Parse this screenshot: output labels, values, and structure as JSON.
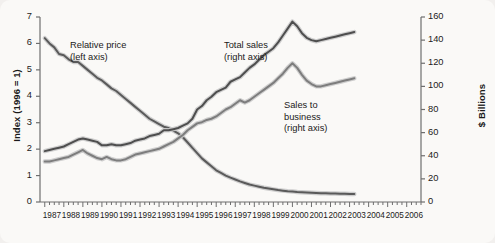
{
  "chart_data": {
    "type": "line",
    "title": "",
    "xlabel": "",
    "ylabel": "Index (1996 = 1)",
    "y2label": "$ Billions",
    "grid": false,
    "legend_position": "inline-annotations",
    "xlim": [
      1986.75,
      2006.75
    ],
    "ylim": [
      0,
      7
    ],
    "y2lim": [
      0,
      160
    ],
    "xticks": [
      "1987",
      "1988",
      "1989",
      "1990",
      "1991",
      "1992",
      "1993",
      "1994",
      "1995",
      "1996",
      "1997",
      "1998",
      "1999",
      "2000",
      "2001",
      "2002",
      "2003",
      "2004",
      "2005",
      "2006"
    ],
    "yticks_left": [
      "0",
      "1",
      "2",
      "3",
      "4",
      "5",
      "6",
      "7"
    ],
    "yticks_right": [
      "0",
      "20",
      "40",
      "60",
      "80",
      "100",
      "120",
      "140",
      "160"
    ],
    "minor_tick_interval_years": 0.25,
    "annotations": [
      {
        "name": "relative-price",
        "line1": "Relative price",
        "line2": "(left axis)"
      },
      {
        "name": "total-sales",
        "line1": "Total sales",
        "line2": "(right axis)"
      },
      {
        "name": "sales-to-business",
        "line1": "Sales to",
        "line2": "business",
        "line3": "(right axis)"
      }
    ],
    "series": [
      {
        "name": "Relative price",
        "axis": "left",
        "units": "index (1996 = 1)",
        "color": "#5a5a5a",
        "x": [
          1987.0,
          1987.25,
          1987.5,
          1987.75,
          1988.0,
          1988.25,
          1988.5,
          1988.75,
          1989.0,
          1989.25,
          1989.5,
          1989.75,
          1990.0,
          1990.25,
          1990.5,
          1990.75,
          1991.0,
          1991.25,
          1991.5,
          1991.75,
          1992.0,
          1992.25,
          1992.5,
          1992.75,
          1993.0,
          1993.25,
          1993.5,
          1993.75,
          1994.0,
          1994.25,
          1994.5,
          1994.75,
          1995.0,
          1995.25,
          1995.5,
          1995.75,
          1996.0,
          1996.25,
          1996.5,
          1996.75,
          1997.0,
          1997.25,
          1997.5,
          1997.75,
          1998.0,
          1998.25,
          1998.5,
          1998.75,
          1999.0,
          1999.25,
          1999.5,
          1999.75,
          2000.0,
          2000.25,
          2000.5,
          2000.75,
          2001.0,
          2001.25,
          2001.5,
          2001.75,
          2002.0,
          2002.25,
          2002.5,
          2002.75,
          2003.0,
          2003.25
        ],
        "y": [
          6.2,
          6.0,
          5.85,
          5.6,
          5.55,
          5.4,
          5.3,
          5.3,
          5.15,
          5.0,
          4.85,
          4.7,
          4.6,
          4.45,
          4.3,
          4.2,
          4.05,
          3.9,
          3.75,
          3.6,
          3.45,
          3.3,
          3.15,
          3.05,
          2.95,
          2.85,
          2.8,
          2.7,
          2.6,
          2.45,
          2.25,
          2.05,
          1.85,
          1.65,
          1.5,
          1.35,
          1.2,
          1.1,
          1.0,
          0.92,
          0.85,
          0.78,
          0.72,
          0.66,
          0.62,
          0.58,
          0.54,
          0.51,
          0.48,
          0.45,
          0.43,
          0.41,
          0.4,
          0.38,
          0.37,
          0.36,
          0.35,
          0.34,
          0.33,
          0.33,
          0.32,
          0.32,
          0.31,
          0.31,
          0.3,
          0.3
        ]
      },
      {
        "name": "Total sales",
        "axis": "right",
        "units": "$ Billions",
        "color": "#4e4e4e",
        "x": [
          1987.0,
          1987.25,
          1987.5,
          1987.75,
          1988.0,
          1988.25,
          1988.5,
          1988.75,
          1989.0,
          1989.25,
          1989.5,
          1989.75,
          1990.0,
          1990.25,
          1990.5,
          1990.75,
          1991.0,
          1991.25,
          1991.5,
          1991.75,
          1992.0,
          1992.25,
          1992.5,
          1992.75,
          1993.0,
          1993.25,
          1993.5,
          1993.75,
          1994.0,
          1994.25,
          1994.5,
          1994.75,
          1995.0,
          1995.25,
          1995.5,
          1995.75,
          1996.0,
          1996.25,
          1996.5,
          1996.75,
          1997.0,
          1997.25,
          1997.5,
          1997.75,
          1998.0,
          1998.25,
          1998.5,
          1998.75,
          1999.0,
          1999.25,
          1999.5,
          1999.75,
          2000.0,
          2000.25,
          2000.5,
          2000.75,
          2001.0,
          2001.25,
          2001.5,
          2001.75,
          2002.0,
          2002.25,
          2002.5,
          2002.75,
          2003.0,
          2003.25
        ],
        "y": [
          44,
          45,
          46,
          47,
          48,
          50,
          52,
          54,
          55,
          54,
          53,
          52,
          49,
          49,
          50,
          49,
          49,
          50,
          51,
          53,
          54,
          55,
          57,
          58,
          59,
          62,
          62,
          63,
          64,
          66,
          68,
          72,
          80,
          83,
          88,
          91,
          95,
          97,
          99,
          104,
          106,
          108,
          112,
          116,
          119,
          123,
          127,
          130,
          133,
          138,
          144,
          150,
          156,
          152,
          146,
          142,
          140,
          139,
          140,
          141,
          142,
          143,
          144,
          145,
          146,
          147
        ]
      },
      {
        "name": "Sales to business",
        "axis": "right",
        "units": "$ Billions",
        "color": "#7d7d7d",
        "x": [
          1987.0,
          1987.25,
          1987.5,
          1987.75,
          1988.0,
          1988.25,
          1988.5,
          1988.75,
          1989.0,
          1989.25,
          1989.5,
          1989.75,
          1990.0,
          1990.25,
          1990.5,
          1990.75,
          1991.0,
          1991.25,
          1991.5,
          1991.75,
          1992.0,
          1992.25,
          1992.5,
          1992.75,
          1993.0,
          1993.25,
          1993.5,
          1993.75,
          1994.0,
          1994.25,
          1994.5,
          1994.75,
          1995.0,
          1995.25,
          1995.5,
          1995.75,
          1996.0,
          1996.25,
          1996.5,
          1996.75,
          1997.0,
          1997.25,
          1997.5,
          1997.75,
          1998.0,
          1998.25,
          1998.5,
          1998.75,
          1999.0,
          1999.25,
          1999.5,
          1999.75,
          2000.0,
          2000.25,
          2000.5,
          2000.75,
          2001.0,
          2001.25,
          2001.5,
          2001.75,
          2002.0,
          2002.25,
          2002.5,
          2002.75,
          2003.0,
          2003.25
        ],
        "y": [
          35,
          35,
          36,
          37,
          38,
          39,
          41,
          43,
          45,
          42,
          40,
          38,
          37,
          39,
          37,
          36,
          36,
          37,
          39,
          41,
          42,
          43,
          44,
          45,
          46,
          48,
          50,
          52,
          55,
          58,
          62,
          65,
          68,
          69,
          71,
          72,
          74,
          77,
          80,
          82,
          85,
          88,
          86,
          88,
          91,
          94,
          97,
          100,
          103,
          107,
          111,
          116,
          120,
          116,
          110,
          105,
          102,
          100,
          100,
          101,
          102,
          103,
          104,
          105,
          106,
          107
        ]
      }
    ]
  }
}
